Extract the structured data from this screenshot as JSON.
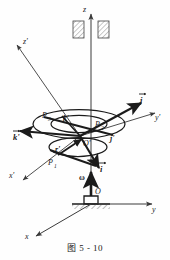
{
  "figure": {
    "caption": "图 5 - 10",
    "ink_color": "#1b1b1b",
    "thin_color": "#3a3a3a",
    "background": "#fefefe"
  },
  "axes": {
    "fixed": [
      {
        "name": "z-axis",
        "label": "z"
      },
      {
        "name": "y-axis",
        "label": "y"
      },
      {
        "name": "x-axis",
        "label": "x"
      }
    ],
    "moving": [
      {
        "name": "z-prime-axis",
        "label": "z'"
      },
      {
        "name": "y-prime-axis",
        "label": "y'"
      },
      {
        "name": "x-prime-axis",
        "label": "x'"
      }
    ]
  },
  "vectors": [
    {
      "name": "i-hat",
      "label": "i"
    },
    {
      "name": "j-hat",
      "label": "j"
    },
    {
      "name": "k-prime-hat",
      "label": "k'"
    },
    {
      "name": "omega",
      "label": "ω"
    },
    {
      "name": "r-prime",
      "label": "r'"
    }
  ],
  "points": [
    {
      "name": "origin-O",
      "label": "O"
    },
    {
      "name": "origin-O-prime",
      "label": "O'"
    },
    {
      "name": "point-P1",
      "label": "P",
      "sub": "1"
    },
    {
      "name": "point-P2",
      "label": "P",
      "sub": "2"
    },
    {
      "name": "point-P3",
      "label": "P",
      "sub": "3"
    }
  ],
  "labels": {
    "z": "z",
    "y": "y",
    "x": "x",
    "z_prime": "z'",
    "y_prime": "y'",
    "x_prime": "x'",
    "i": "i",
    "j": "j",
    "k_prime": "k'",
    "j_prime": "j'",
    "omega": "ω",
    "r_prime": "r'",
    "O": "O",
    "O_prime": "O'",
    "P1": "P",
    "P1_sub": "1",
    "P2": "P",
    "P2_sub": "2",
    "P3": "P",
    "P3_sub": "3"
  },
  "shapes": {
    "bearing_label": "bearing-hatched-blocks",
    "ellipse_outer": "disk-outer-ellipse",
    "ellipse_inner": "disk-inner-ellipse",
    "ellipse_lower": "disk-lower-ellipse",
    "ground_support": "ground-support-hatched"
  }
}
